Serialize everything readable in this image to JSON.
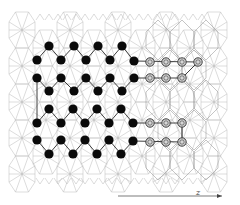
{
  "figure": {
    "colors": {
      "background": "#ffffff",
      "wireframe": "#b8b8b8",
      "wireframe_dark": "#8a8a8a",
      "filled_site": "#0a0a0a",
      "open_site_stroke": "#3a3a3a",
      "open_site_fill": "#d6d6d6",
      "bond": "#2a2a2a"
    },
    "axis": {
      "label": "z",
      "arrow_from": [
        118,
        196
      ],
      "arrow_to": [
        222,
        196
      ]
    },
    "filled_sites": [
      [
        49,
        46
      ],
      [
        74,
        46
      ],
      [
        98,
        46
      ],
      [
        122,
        46
      ],
      [
        37,
        60
      ],
      [
        61,
        60
      ],
      [
        86,
        60
      ],
      [
        110,
        60
      ],
      [
        134,
        61
      ],
      [
        37,
        78
      ],
      [
        61,
        78
      ],
      [
        86,
        78
      ],
      [
        110,
        78
      ],
      [
        134,
        78
      ],
      [
        49,
        91
      ],
      [
        74,
        91
      ],
      [
        98,
        91
      ],
      [
        122,
        91
      ],
      [
        49,
        109
      ],
      [
        73,
        109
      ],
      [
        97,
        109
      ],
      [
        121,
        109
      ],
      [
        37,
        123
      ],
      [
        61,
        123
      ],
      [
        85,
        123
      ],
      [
        109,
        123
      ],
      [
        133,
        123
      ],
      [
        37,
        140
      ],
      [
        61,
        140
      ],
      [
        85,
        140
      ],
      [
        109,
        140
      ],
      [
        133,
        141
      ],
      [
        49,
        154
      ],
      [
        73,
        154
      ],
      [
        97,
        154
      ],
      [
        121,
        154
      ]
    ],
    "open_sites": [
      [
        150,
        62
      ],
      [
        166,
        62
      ],
      [
        182,
        62
      ],
      [
        198,
        62
      ],
      [
        150,
        78
      ],
      [
        166,
        78
      ],
      [
        182,
        78
      ],
      [
        150,
        123
      ],
      [
        166,
        123
      ],
      [
        182,
        123
      ],
      [
        150,
        142
      ],
      [
        166,
        142
      ],
      [
        182,
        142
      ]
    ],
    "bonds": [
      [
        49,
        46,
        37,
        60
      ],
      [
        49,
        46,
        61,
        60
      ],
      [
        74,
        46,
        61,
        60
      ],
      [
        74,
        46,
        86,
        60
      ],
      [
        98,
        46,
        86,
        60
      ],
      [
        98,
        46,
        110,
        60
      ],
      [
        122,
        46,
        110,
        60
      ],
      [
        122,
        46,
        134,
        61
      ],
      [
        37,
        78,
        49,
        91
      ],
      [
        61,
        78,
        49,
        91
      ],
      [
        61,
        78,
        74,
        91
      ],
      [
        86,
        78,
        74,
        91
      ],
      [
        86,
        78,
        98,
        91
      ],
      [
        110,
        78,
        98,
        91
      ],
      [
        110,
        78,
        122,
        91
      ],
      [
        134,
        78,
        122,
        91
      ],
      [
        49,
        109,
        37,
        123
      ],
      [
        49,
        109,
        61,
        123
      ],
      [
        73,
        109,
        61,
        123
      ],
      [
        73,
        109,
        85,
        123
      ],
      [
        97,
        109,
        85,
        123
      ],
      [
        97,
        109,
        109,
        123
      ],
      [
        121,
        109,
        109,
        123
      ],
      [
        121,
        109,
        133,
        123
      ],
      [
        37,
        140,
        49,
        154
      ],
      [
        61,
        140,
        49,
        154
      ],
      [
        61,
        140,
        73,
        154
      ],
      [
        85,
        140,
        73,
        154
      ],
      [
        85,
        140,
        97,
        154
      ],
      [
        109,
        140,
        97,
        154
      ],
      [
        109,
        140,
        121,
        154
      ],
      [
        133,
        141,
        121,
        154
      ],
      [
        37,
        78,
        37,
        123
      ],
      [
        134,
        61,
        198,
        62
      ],
      [
        134,
        78,
        182,
        78
      ],
      [
        133,
        123,
        182,
        123
      ],
      [
        133,
        141,
        182,
        142
      ],
      [
        198,
        62,
        182,
        78
      ],
      [
        182,
        123,
        182,
        142
      ]
    ]
  }
}
